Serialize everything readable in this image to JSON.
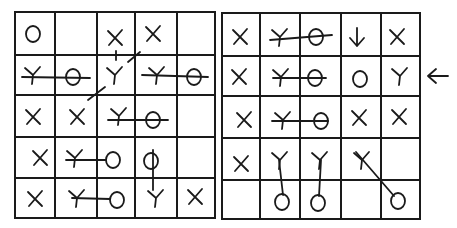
{
  "symbols": {
    "X": "cross mark",
    "Y": "Y-shaped mark",
    "O": "circle mark",
    "Y-O": "Y connected to O by a line"
  },
  "left_grid": {
    "rows": 5,
    "cols": 5,
    "cells": [
      [
        "O",
        "",
        "X",
        "X",
        ""
      ],
      [
        "Y",
        "O",
        "Y",
        "Y",
        "O"
      ],
      [
        "X",
        "X",
        "Y",
        "O",
        ""
      ],
      [
        "X",
        "Y",
        "O",
        "O",
        ""
      ],
      [
        "X",
        "Y",
        "O",
        "Y",
        "X"
      ]
    ],
    "connections": [
      {
        "from": [
          1,
          0
        ],
        "to": [
          1,
          1
        ],
        "type": "horizontal"
      },
      {
        "from": [
          1,
          3
        ],
        "to": [
          1,
          4
        ],
        "type": "horizontal"
      },
      {
        "from": [
          2,
          2
        ],
        "to": [
          2,
          3
        ],
        "type": "horizontal"
      },
      {
        "from": [
          3,
          1
        ],
        "to": [
          3,
          2
        ],
        "type": "horizontal"
      },
      {
        "from": [
          4,
          1
        ],
        "to": [
          4,
          2
        ],
        "type": "horizontal"
      },
      {
        "from": [
          3,
          3
        ],
        "to": [
          4,
          3
        ],
        "type": "vertical"
      },
      {
        "from": [
          0,
          2
        ],
        "to": [
          1,
          2
        ],
        "type": "dashed-vertical"
      },
      {
        "from": [
          0,
          3
        ],
        "to": [
          2,
          1
        ],
        "type": "dashed-diagonal"
      }
    ]
  },
  "right_grid": {
    "rows": 5,
    "cols": 5,
    "cells": [
      [
        "X",
        "Y",
        "O",
        "arrow-down",
        "X"
      ],
      [
        "X",
        "Y",
        "O",
        "O",
        "Y"
      ],
      [
        "X",
        "Y",
        "O",
        "X",
        "X"
      ],
      [
        "X",
        "Y",
        "Y",
        "Y",
        ""
      ],
      [
        "",
        "O",
        "O",
        "",
        "O"
      ]
    ],
    "connections": [
      {
        "from": [
          0,
          1
        ],
        "to": [
          0,
          2
        ],
        "type": "horizontal"
      },
      {
        "from": [
          1,
          1
        ],
        "to": [
          1,
          2
        ],
        "type": "horizontal"
      },
      {
        "from": [
          2,
          1
        ],
        "to": [
          2,
          2
        ],
        "type": "horizontal"
      },
      {
        "from": [
          3,
          1
        ],
        "to": [
          4,
          1
        ],
        "type": "vertical"
      },
      {
        "from": [
          3,
          2
        ],
        "to": [
          4,
          2
        ],
        "type": "vertical"
      },
      {
        "from": [
          3,
          3
        ],
        "to": [
          4,
          4
        ],
        "type": "diagonal"
      }
    ]
  },
  "annotations": {
    "row_pointer": {
      "symbol": "←",
      "target": "right_grid row 2"
    },
    "cell_arrow": {
      "symbol": "↓",
      "target": "right_grid row 1 col 4"
    }
  }
}
